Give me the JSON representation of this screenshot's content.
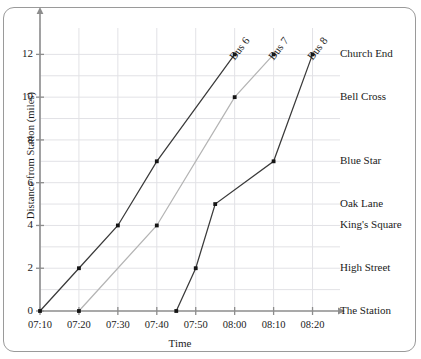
{
  "chart_data": {
    "type": "line",
    "title": "",
    "xlabel": "Time",
    "ylabel": "Distance from Station (miles)",
    "x_tick_labels": [
      "07:10",
      "07:20",
      "07:30",
      "07:40",
      "07:50",
      "08:00",
      "08:10",
      "08:20"
    ],
    "x_tick_minutes": [
      430,
      440,
      450,
      460,
      470,
      480,
      490,
      500
    ],
    "y_tick_labels": [
      "0",
      "2",
      "4",
      "6",
      "8",
      "10",
      "12"
    ],
    "y_ticks": [
      0,
      2,
      4,
      6,
      8,
      10,
      12
    ],
    "xlim_minutes": [
      430,
      505
    ],
    "ylim": [
      0,
      13
    ],
    "grid": "both-axes-light",
    "legend_position": "at-line-ends-rotated",
    "stops": [
      {
        "name": "The Station",
        "distance": 0
      },
      {
        "name": "High Street",
        "distance": 2
      },
      {
        "name": "King's Square",
        "distance": 4
      },
      {
        "name": "Oak Lane",
        "distance": 5
      },
      {
        "name": "Blue Star",
        "distance": 7
      },
      {
        "name": "Bell Cross",
        "distance": 10
      },
      {
        "name": "Church End",
        "distance": 12
      }
    ],
    "series": [
      {
        "name": "Bus 6",
        "color": "#3a3a3a",
        "points": [
          {
            "time": "07:10",
            "minutes": 430,
            "distance": 0
          },
          {
            "time": "07:20",
            "minutes": 440,
            "distance": 2
          },
          {
            "time": "07:30",
            "minutes": 450,
            "distance": 4
          },
          {
            "time": "07:40",
            "minutes": 460,
            "distance": 7
          },
          {
            "time": "08:00",
            "minutes": 480,
            "distance": 12
          }
        ]
      },
      {
        "name": "Bus 7",
        "color": "#b4b4b4",
        "points": [
          {
            "time": "07:20",
            "minutes": 440,
            "distance": 0
          },
          {
            "time": "07:40",
            "minutes": 460,
            "distance": 4
          },
          {
            "time": "08:00",
            "minutes": 480,
            "distance": 10
          },
          {
            "time": "08:10",
            "minutes": 490,
            "distance": 12
          }
        ]
      },
      {
        "name": "Bus 8",
        "color": "#3a3a3a",
        "points": [
          {
            "time": "07:45",
            "minutes": 465,
            "distance": 0
          },
          {
            "time": "07:50",
            "minutes": 470,
            "distance": 2
          },
          {
            "time": "07:55",
            "minutes": 475,
            "distance": 5
          },
          {
            "time": "08:10",
            "minutes": 490,
            "distance": 7
          },
          {
            "time": "08:20",
            "minutes": 500,
            "distance": 12
          }
        ]
      }
    ]
  },
  "axes": {
    "y_title": "Distance from Station (miles)",
    "x_title": "Time"
  }
}
